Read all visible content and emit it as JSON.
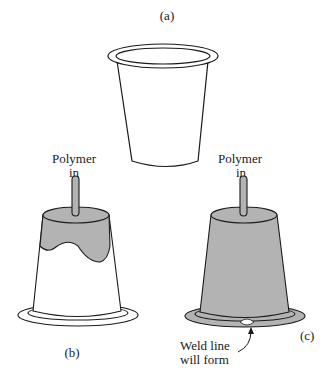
{
  "figure": {
    "panels": [
      {
        "id": "a",
        "label": "(a)",
        "description": "Empty cup (part shape)"
      },
      {
        "id": "b",
        "label": "(b)",
        "inlet_label_line1": "Polymer",
        "inlet_label_line2": "in",
        "description": "Mold partially filled"
      },
      {
        "id": "c",
        "label": "(c)",
        "inlet_label_line1": "Polymer",
        "inlet_label_line2": "in",
        "annotation_line1": "Weld line",
        "annotation_line2": "will form",
        "description": "Mold nearly filled; flow fronts meet at rim"
      }
    ],
    "colors": {
      "line": "#1a1a1a",
      "polymer_fill": "#b3b3b3",
      "background": "#ffffff"
    }
  }
}
